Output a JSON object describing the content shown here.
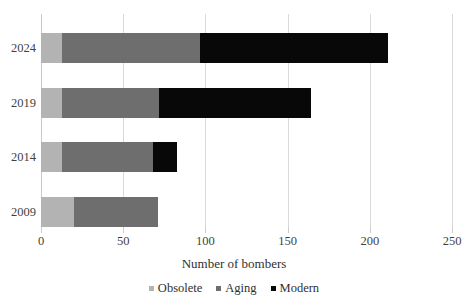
{
  "chart_data": {
    "type": "bar",
    "orientation": "horizontal",
    "stacked": true,
    "title": "",
    "xlabel": "Number of bombers",
    "ylabel": "",
    "xlim": [
      0,
      250
    ],
    "xticks": [
      0,
      50,
      100,
      150,
      200,
      250
    ],
    "xtick_labels": [
      "0",
      "50",
      "100",
      "150",
      "200",
      "250"
    ],
    "categories": [
      "2024",
      "2019",
      "2014",
      "2009"
    ],
    "grid": "vertical",
    "legend_position": "bottom-center",
    "series": [
      {
        "name": "Obsolete",
        "color": "#b3b3b3",
        "values": [
          13,
          13,
          13,
          20
        ]
      },
      {
        "name": "Aging",
        "color": "#6e6e6e",
        "values": [
          84,
          59,
          55,
          51
        ]
      },
      {
        "name": "Modern",
        "color": "#080808",
        "values": [
          114,
          92,
          15,
          0
        ]
      }
    ],
    "totals": [
      211,
      164,
      83,
      71
    ]
  },
  "axis": {
    "x_title": "Number of bombers"
  },
  "legend": {
    "items": [
      {
        "label": "Obsolete",
        "color": "#b3b3b3"
      },
      {
        "label": "Aging",
        "color": "#6e6e6e"
      },
      {
        "label": "Modern",
        "color": "#080808"
      }
    ]
  },
  "colors": {
    "gridline": "#d9d9d9",
    "axis": "#c9c9c9",
    "text": "#3a3a3a",
    "background": "#ffffff"
  }
}
